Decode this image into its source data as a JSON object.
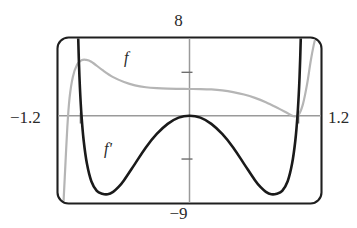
{
  "chart_data": {
    "type": "line",
    "title": "",
    "subtitle": "",
    "xlabel": "",
    "ylabel": "",
    "xlim": [
      -1.2,
      1.2
    ],
    "ylim": [
      -9,
      8
    ],
    "grid": false,
    "legend": "inline-curve-labels",
    "axis_labels": {
      "top": "8",
      "bottom": "−9",
      "left": "−1.2",
      "right": "1.2"
    },
    "x_ticks": [
      -1,
      1
    ],
    "y_ticks": [
      -4.5,
      4.5
    ],
    "series": [
      {
        "name": "f",
        "label": "f",
        "color": "#b5b5b5",
        "x": [
          -1.155,
          -1.14,
          -1.12,
          -1.1,
          -1.07,
          -1.03,
          -0.99,
          -0.95,
          -0.9,
          -0.8,
          -0.7,
          -0.6,
          -0.5,
          -0.4,
          -0.3,
          -0.2,
          -0.1,
          0.0,
          0.1,
          0.2,
          0.3,
          0.4,
          0.5,
          0.6,
          0.7,
          0.8,
          0.9,
          0.95,
          1.0,
          1.04,
          1.08,
          1.11,
          1.14,
          1.155
        ],
        "y": [
          -9.0,
          -5.6,
          -1.2,
          1.8,
          4.0,
          5.3,
          5.75,
          5.8,
          5.6,
          4.75,
          4.0,
          3.5,
          3.15,
          2.95,
          2.85,
          2.8,
          2.78,
          2.77,
          2.76,
          2.72,
          2.62,
          2.45,
          2.2,
          1.85,
          1.4,
          0.85,
          0.25,
          -0.05,
          0.1,
          1.2,
          3.4,
          5.6,
          7.4,
          8.0
        ]
      },
      {
        "name": "f'",
        "label": "f'",
        "color": "#1a1a1a",
        "x": [
          -1.02,
          -1.015,
          -1.005,
          -0.99,
          -0.97,
          -0.94,
          -0.9,
          -0.85,
          -0.8,
          -0.75,
          -0.7,
          -0.65,
          -0.6,
          -0.5,
          -0.4,
          -0.3,
          -0.2,
          -0.1,
          0.0,
          0.1,
          0.2,
          0.3,
          0.4,
          0.5,
          0.6,
          0.65,
          0.7,
          0.75,
          0.8,
          0.85,
          0.9,
          0.94,
          0.97,
          0.99,
          1.005,
          1.015,
          1.02
        ],
        "y": [
          8.0,
          6.0,
          3.0,
          0.0,
          -2.6,
          -5.0,
          -6.8,
          -7.8,
          -8.1,
          -8.15,
          -7.9,
          -7.4,
          -6.7,
          -5.0,
          -3.3,
          -1.9,
          -0.85,
          -0.2,
          0.0,
          -0.2,
          -0.85,
          -1.9,
          -3.3,
          -5.0,
          -6.7,
          -7.4,
          -7.9,
          -8.15,
          -8.1,
          -7.8,
          -6.8,
          -5.0,
          -2.6,
          0.0,
          3.0,
          6.0,
          8.0
        ]
      }
    ]
  },
  "labels": {
    "top": "8",
    "bottom": "−9",
    "left": "−1.2",
    "right": "1.2",
    "curve_f": "f",
    "curve_f_prime": "f'"
  },
  "colors": {
    "frame": "#1f1f1f",
    "axis": "#9a9a9a",
    "curve_f": "#b5b5b5",
    "curve_f_prime": "#1a1a1a",
    "background": "#ffffff"
  }
}
